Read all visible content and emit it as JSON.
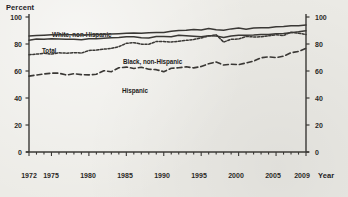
{
  "chart_data": {
    "type": "line",
    "title": "",
    "xlabel": "Year",
    "ylabel": "Percent",
    "ylim": [
      0,
      100
    ],
    "xlim": [
      1972,
      2009
    ],
    "yticks": [
      0,
      20,
      40,
      60,
      80,
      100
    ],
    "xticks": [
      1972,
      1975,
      1980,
      1985,
      1990,
      1995,
      2000,
      2005,
      2009
    ],
    "xtick_labels": [
      "1972",
      "1975",
      "1980",
      "1985",
      "1990",
      "1995",
      "2000",
      "2005",
      "2009"
    ],
    "ytick_labels": [
      "0",
      "20",
      "40",
      "60",
      "80",
      "100"
    ],
    "grid": false,
    "legend_position": "inline-annotations",
    "right_axis_mirrored": true,
    "x": [
      1972,
      1973,
      1974,
      1975,
      1976,
      1977,
      1978,
      1979,
      1980,
      1981,
      1982,
      1983,
      1984,
      1985,
      1986,
      1987,
      1988,
      1989,
      1990,
      1991,
      1992,
      1993,
      1994,
      1995,
      1996,
      1997,
      1998,
      1999,
      2000,
      2001,
      2002,
      2003,
      2004,
      2005,
      2006,
      2007,
      2008,
      2009
    ],
    "series": [
      {
        "name": "White, non-Hispanic",
        "style": "solid",
        "color": "#3a3835",
        "values": [
          86.0,
          86.3,
          86.5,
          86.8,
          86.9,
          86.9,
          86.8,
          86.7,
          86.9,
          87.1,
          87.3,
          87.4,
          87.6,
          87.9,
          88.1,
          88.0,
          88.3,
          88.5,
          88.5,
          89.4,
          90.0,
          90.1,
          90.7,
          90.3,
          91.5,
          90.5,
          90.2,
          91.2,
          91.8,
          91.0,
          91.8,
          92.0,
          92.0,
          92.8,
          93.0,
          93.5,
          93.5,
          94.0
        ]
      },
      {
        "name": "Total",
        "style": "solid",
        "color": "#3a3835",
        "values": [
          82.8,
          83.7,
          83.6,
          83.9,
          83.7,
          83.6,
          83.5,
          83.1,
          83.9,
          83.8,
          84.3,
          84.6,
          84.8,
          85.4,
          85.4,
          84.7,
          84.5,
          85.5,
          85.6,
          85.4,
          86.4,
          86.2,
          85.8,
          85.3,
          86.2,
          85.9,
          84.8,
          85.9,
          86.5,
          86.5,
          86.6,
          87.0,
          87.1,
          87.6,
          87.8,
          88.4,
          89.0,
          89.8
        ]
      },
      {
        "name": "Black, non-Hispanic",
        "style": "dotted",
        "color": "#3a3835",
        "values": [
          72.1,
          72.5,
          73.1,
          72.5,
          73.5,
          73.2,
          73.6,
          73.3,
          75.2,
          75.5,
          76.2,
          76.7,
          78.0,
          80.5,
          81.0,
          79.9,
          79.8,
          81.9,
          81.8,
          81.5,
          82.0,
          82.7,
          83.3,
          84.5,
          85.9,
          86.9,
          81.4,
          83.5,
          83.7,
          85.6,
          85.2,
          85.3,
          86.0,
          86.8,
          86.3,
          88.8,
          87.9,
          87.1
        ]
      },
      {
        "name": "Hispanic",
        "style": "dashed",
        "color": "#3a3835",
        "values": [
          56.2,
          57.0,
          57.8,
          58.4,
          58.4,
          57.0,
          58.0,
          57.3,
          57.1,
          57.6,
          60.2,
          59.5,
          62.4,
          62.9,
          61.9,
          62.8,
          61.3,
          61.0,
          59.5,
          62.0,
          62.4,
          63.1,
          62.3,
          63.3,
          65.4,
          66.7,
          64.4,
          65.0,
          64.7,
          66.0,
          67.3,
          69.8,
          70.5,
          69.9,
          71.0,
          73.5,
          74.5,
          76.8
        ]
      }
    ],
    "annotations": [
      {
        "text": "White, non-Hispanic",
        "x_px": 52,
        "y_px": 31
      },
      {
        "text": "Total",
        "x_px": 42,
        "y_px": 47
      },
      {
        "text": "Black, non-Hispanic",
        "x_px": 123,
        "y_px": 58
      },
      {
        "text": "Hispanic",
        "x_px": 122,
        "y_px": 87
      }
    ]
  },
  "axes": {
    "left_title": "Percent",
    "right_title": "Year"
  }
}
